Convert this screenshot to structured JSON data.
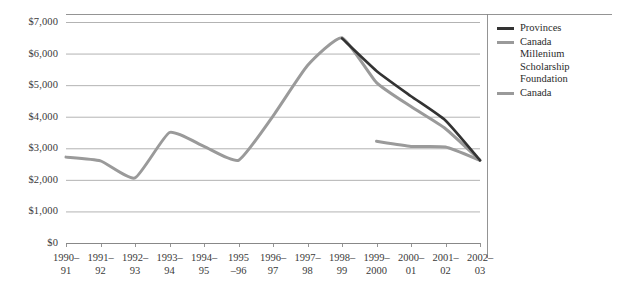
{
  "chart_data": {
    "type": "line",
    "title": "",
    "xlabel": "",
    "ylabel": "",
    "ylim": [
      0,
      7000
    ],
    "ytick_step": 1000,
    "grid": true,
    "legend_position": "right",
    "categories": [
      "1990–\n91",
      "1991–\n92",
      "1992–\n93",
      "1993–\n94",
      "1994–\n95",
      "1995\n–96",
      "1996–\n97",
      "1997–\n98",
      "1998–\n99",
      "1999–\n2000",
      "2000–\n01",
      "2001–\n02",
      "2002–\n03"
    ],
    "ytick_labels": [
      "$7,000",
      "$6,000",
      "$5,000",
      "$4,000",
      "$3,000",
      "$2,000",
      "$1,000",
      "$0"
    ],
    "ytick_values": [
      7000,
      6000,
      5000,
      4000,
      3000,
      2000,
      1000,
      0
    ],
    "series": [
      {
        "name": "Provinces",
        "color": "#333333",
        "values": [
          null,
          null,
          null,
          null,
          null,
          null,
          null,
          null,
          6480,
          5450,
          4650,
          3880,
          2620
        ]
      },
      {
        "name": "Canada Millenium Scholarship Foundation",
        "color": "#9a9a9a",
        "values": [
          null,
          null,
          null,
          null,
          null,
          null,
          null,
          null,
          null,
          3220,
          3060,
          3040,
          2620
        ]
      },
      {
        "name": "Canada",
        "color": "#9a9a9a",
        "values": [
          2720,
          2600,
          2060,
          3500,
          3060,
          2620,
          4020,
          5620,
          6500,
          5080,
          4320,
          3620,
          2620
        ]
      }
    ],
    "legend": [
      {
        "label": "Provinces",
        "color": "#333333"
      },
      {
        "label": "Canada\n    Millenium\n    Scholarship\n    Foundation",
        "color": "#9a9a9a"
      },
      {
        "label": "Canada",
        "color": "#9a9a9a"
      }
    ]
  },
  "axis": {
    "gridline_color": "#aaaaaa",
    "axis_color": "#888888",
    "separator_color": "#888888"
  }
}
